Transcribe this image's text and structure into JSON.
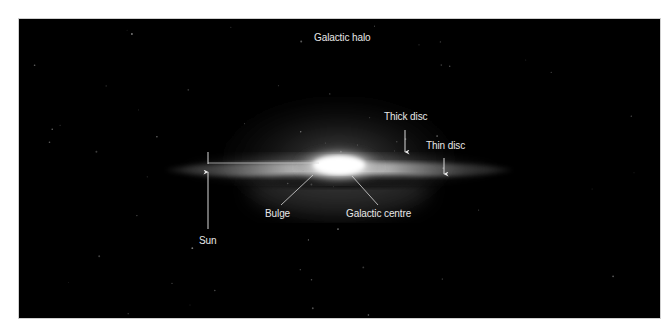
{
  "figure": {
    "background": "#000000",
    "label_color": "#e8e8e8",
    "line_color": "#d8d8d8",
    "labels": {
      "halo": "Galactic halo",
      "thick_disc": "Thick disc",
      "thin_disc": "Thin disc",
      "bulge": "Bulge",
      "centre": "Galactic centre",
      "sun": "Sun"
    }
  }
}
